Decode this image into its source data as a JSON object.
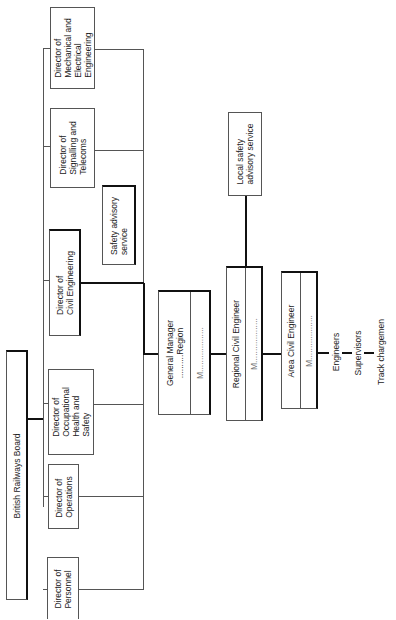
{
  "diagram": {
    "type": "organisation-chart",
    "orientation": "rotated-90-ccw",
    "board": {
      "label": "British Railways Board"
    },
    "directors": [
      {
        "label": "Director of\nMechanical and\nElectrical\nEngineering"
      },
      {
        "label": "Director of\nSignalling and\nTelecoms"
      },
      {
        "label": "Director of\nCivil Engineering"
      },
      {
        "label": "Director of\nOccupational\nHealth and\nSafety"
      },
      {
        "label": "Director of\nOperations"
      },
      {
        "label": "Director of\nPersonnel"
      }
    ],
    "safety_advisory": {
      "label": "Safety advisory\nservice"
    },
    "general_manager": {
      "title": "General Manager\n..........Region",
      "name": "M..................."
    },
    "regional_civil_engineer": {
      "title": "Regional Civil Engineer",
      "name": "M..................."
    },
    "local_safety_advisory": {
      "label": "Local safety\nadvisory service"
    },
    "area_civil_engineer": {
      "title": "Area Civil Engineer",
      "name": "M..................."
    },
    "staff_chain": [
      "Engineers",
      "Supervisors",
      "Track chargemen"
    ]
  }
}
